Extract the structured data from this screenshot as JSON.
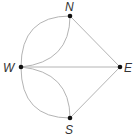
{
  "diagram": {
    "type": "graph",
    "vertices": [
      {
        "id": "N",
        "label": "N",
        "x": 70,
        "y": 16
      },
      {
        "id": "E",
        "label": "E",
        "x": 120,
        "y": 67
      },
      {
        "id": "S",
        "label": "S",
        "x": 70,
        "y": 118
      },
      {
        "id": "W",
        "label": "W",
        "x": 21,
        "y": 67
      }
    ],
    "edges": [
      {
        "from": "W",
        "to": "N",
        "shape": "arc-outer"
      },
      {
        "from": "W",
        "to": "N",
        "shape": "arc-inner"
      },
      {
        "from": "W",
        "to": "S",
        "shape": "arc-outer"
      },
      {
        "from": "W",
        "to": "S",
        "shape": "arc-inner"
      },
      {
        "from": "W",
        "to": "E",
        "shape": "straight"
      },
      {
        "from": "N",
        "to": "E",
        "shape": "straight"
      },
      {
        "from": "S",
        "to": "E",
        "shape": "straight"
      }
    ],
    "colors": {
      "edge": "#b4b4b4",
      "vertex": "#111111",
      "label": "#333333"
    }
  }
}
